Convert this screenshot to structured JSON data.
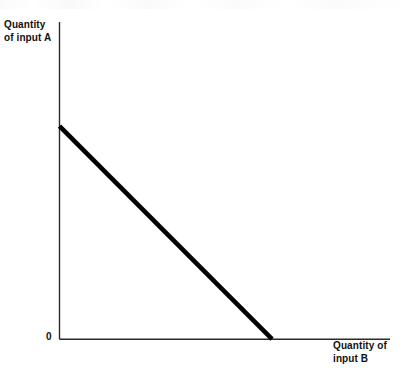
{
  "chart_data": {
    "type": "line",
    "title": "",
    "subtitle": "",
    "xlabel": "Quantity of input B",
    "ylabel": "Quantity of input A",
    "xlabel_lines": [
      "Quantity of",
      "input B"
    ],
    "ylabel_lines": [
      "Quantity",
      "of input A"
    ],
    "origin_label": "0",
    "grid": false,
    "legend": "none",
    "xlim": [
      0,
      1.555
    ],
    "ylim": [
      0,
      1.489
    ],
    "x_ticks": [],
    "y_ticks": [],
    "annotations": [],
    "series": [
      {
        "name": "isoquant",
        "description": "downward-sloping straight line (linear isoquant)",
        "color": "#000000",
        "linewidth": 4.6,
        "x": [
          0,
          1
        ],
        "y": [
          1,
          0
        ],
        "points": [
          {
            "x": 0,
            "y": 1
          },
          {
            "x": 1,
            "y": 0
          }
        ]
      }
    ],
    "axes": {
      "color": "#2b2b2b",
      "linewidth": 1.4,
      "y_axis_top_value": 1.489,
      "x_axis_right_value": 1.555
    }
  },
  "figure": {
    "background": "#ffffff",
    "width": 409,
    "height": 390
  }
}
